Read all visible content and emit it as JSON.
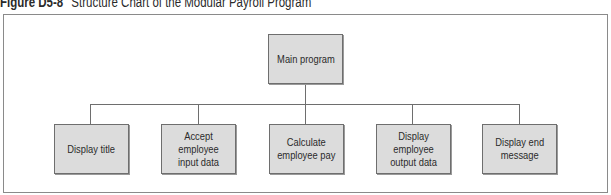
{
  "figure": {
    "label": "Figure D5-8",
    "caption": "Structure Chart of the Modular Payroll Program"
  },
  "chart": {
    "root": {
      "label": "Main program"
    },
    "children": [
      {
        "label": "Display title"
      },
      {
        "label": "Accept employee\ninput data"
      },
      {
        "label": "Calculate\nemployee pay"
      },
      {
        "label": "Display\nemployee\noutput data"
      },
      {
        "label": "Display end\nmessage"
      }
    ]
  },
  "colors": {
    "box_fill": "#dcdcdc",
    "box_border": "#6e6e6e",
    "connector": "#6e6e6e",
    "frame": "#8a8a8a"
  }
}
